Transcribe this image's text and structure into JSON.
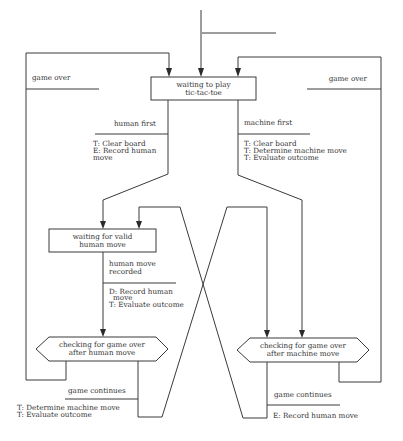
{
  "diagram": {
    "colors": {
      "line": "#3a3a3a",
      "text": "#333333",
      "background": "#ffffff"
    },
    "states": {
      "waiting_to_play": {
        "line1": "waiting to play",
        "line2": "tic-tac-toe"
      },
      "waiting_human": {
        "line1": "waiting for valid",
        "line2": "human move"
      },
      "check_human": {
        "line1": "checking for game over",
        "line2": "after human move"
      },
      "check_machine": {
        "line1": "checking for game over",
        "line2": "after machine move"
      }
    },
    "transitions": {
      "game_over_left": {
        "event": "game over"
      },
      "game_over_right": {
        "event": "game over"
      },
      "human_first": {
        "event": "human first",
        "actions": [
          "T: Clear board",
          "E: Record human",
          "move"
        ]
      },
      "machine_first": {
        "event": "machine first",
        "actions": [
          "T: Clear board",
          "T: Determine machine move",
          "T: Evaluate outcome"
        ]
      },
      "human_move_recorded": {
        "event_line1": "human move",
        "event_line2": "recorded",
        "actions": [
          "D: Record human",
          "move",
          "T: Evaluate outcome"
        ]
      },
      "game_continues_human": {
        "event": "game continues",
        "actions": [
          "T: Determine machine move",
          "T: Evaluate outcome"
        ]
      },
      "game_continues_machine": {
        "event": "game continues",
        "actions": [
          "E: Record human move"
        ]
      }
    }
  }
}
